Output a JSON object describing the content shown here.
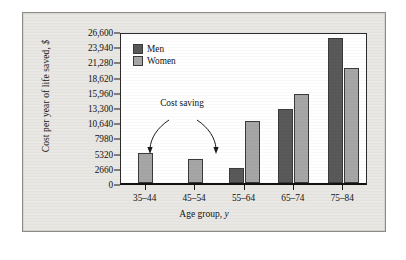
{
  "figure": {
    "y_axis_title": "Cost per year of life saved, ",
    "y_axis_title_italic": "$",
    "x_axis_title": "Age group, ",
    "x_axis_title_italic": "y",
    "annotation": "Cost saving",
    "legend": [
      {
        "key": "men",
        "label": "Men",
        "color": "#595959"
      },
      {
        "key": "women",
        "label": "Women",
        "color": "#a6a6a6"
      }
    ]
  },
  "chart_data": {
    "type": "bar",
    "title": "",
    "xlabel": "Age group, y",
    "ylabel": "Cost per year of life saved, $",
    "categories": [
      "35–44",
      "45–54",
      "55–64",
      "65–74",
      "75–84"
    ],
    "series": [
      {
        "name": "Men",
        "color": "#595959",
        "values": [
          null,
          null,
          2700,
          12900,
          25400
        ]
      },
      {
        "name": "Women",
        "color": "#a6a6a6",
        "values": [
          5300,
          4200,
          10800,
          15600,
          20100
        ]
      }
    ],
    "ylim": [
      0,
      26600
    ],
    "yticks": [
      0,
      2660,
      5320,
      7980,
      10640,
      13300,
      15960,
      18620,
      21280,
      23940,
      26600
    ],
    "ytick_labels": [
      "0",
      "2660",
      "5320",
      "7980",
      "10,640",
      "13,300",
      "15,960",
      "18,620",
      "21,280",
      "23,940",
      "26,600"
    ],
    "grid": false,
    "legend_position": "top-left-inside",
    "annotations": [
      {
        "text": "Cost saving",
        "points_to": [
          "35–44",
          "45–54"
        ]
      }
    ]
  }
}
